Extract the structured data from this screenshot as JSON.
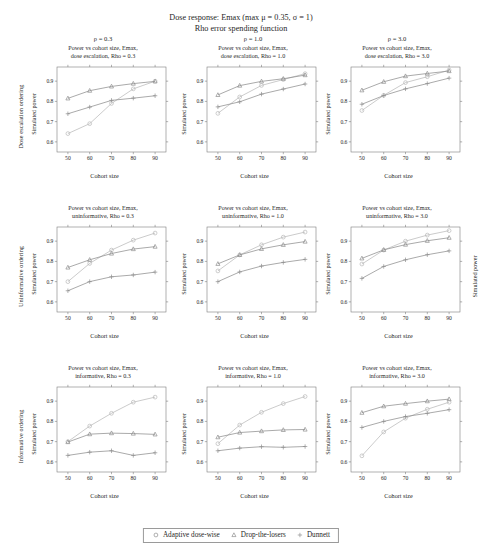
{
  "title": {
    "line1": "Dose response: Emax (max μ = 0.35, σ = 1)",
    "line2": "Rho error spending function"
  },
  "axes": {
    "xlabel": "Cohort size",
    "ylabel": "Simulated power",
    "xticks": [
      "50",
      "60",
      "70",
      "80",
      "90"
    ],
    "yticks": [
      "0.6",
      "0.7",
      "0.8",
      "0.9"
    ]
  },
  "rows": [
    {
      "label": "Dose escalation ordering",
      "key": "dose escalation"
    },
    {
      "label": "Uninformative ordering",
      "key": "uninformative"
    },
    {
      "label": "Informative ordering",
      "key": "informative"
    }
  ],
  "columns": [
    {
      "rho_head": "ρ = 0.3",
      "rho": "0.3"
    },
    {
      "rho_head": "ρ = 1.0",
      "rho": "1.0"
    },
    {
      "rho_head": "ρ = 3.0",
      "rho": "3.0"
    }
  ],
  "legend": {
    "items": [
      {
        "label": "Adaptive dose-wise",
        "marker": "circle-marker"
      },
      {
        "label": "Drop-the-losers",
        "marker": "triangle-marker"
      },
      {
        "label": "Dunnett",
        "marker": "plus-marker"
      }
    ]
  },
  "chart_data": [
    {
      "type": "line",
      "row": 0,
      "col": 0,
      "title_line1": "Power vs cohort size, Emax,",
      "title_line2": "dose escalation, Rho = 0.3",
      "xlabel": "Cohort size",
      "ylabel": "Simulated power",
      "x": [
        50,
        60,
        70,
        80,
        90
      ],
      "xlim": [
        45,
        95
      ],
      "ylim": [
        0.55,
        0.97
      ],
      "grid": false,
      "series": [
        {
          "name": "Adaptive dose-wise",
          "values": [
            0.641,
            0.69,
            0.79,
            0.862,
            0.9
          ]
        },
        {
          "name": "Drop-the-losers",
          "values": [
            0.815,
            0.853,
            0.874,
            0.888,
            0.899
          ]
        },
        {
          "name": "Dunnett",
          "values": [
            0.739,
            0.772,
            0.805,
            0.816,
            0.828
          ]
        }
      ]
    },
    {
      "type": "line",
      "row": 0,
      "col": 1,
      "title_line1": "Power vs cohort size, Emax,",
      "title_line2": "dose escalation, Rho = 1.0",
      "xlabel": "Cohort size",
      "ylabel": "Simulated power",
      "x": [
        50,
        60,
        70,
        80,
        90
      ],
      "xlim": [
        45,
        95
      ],
      "ylim": [
        0.55,
        0.97
      ],
      "grid": false,
      "series": [
        {
          "name": "Adaptive dose-wise",
          "values": [
            0.741,
            0.822,
            0.879,
            0.908,
            0.937
          ]
        },
        {
          "name": "Drop-the-losers",
          "values": [
            0.832,
            0.878,
            0.899,
            0.912,
            0.93
          ]
        },
        {
          "name": "Dunnett",
          "values": [
            0.773,
            0.798,
            0.836,
            0.861,
            0.886
          ]
        }
      ]
    },
    {
      "type": "line",
      "row": 0,
      "col": 2,
      "title_line1": "Power vs cohort size, Emax,",
      "title_line2": "dose escalation, Rho = 3.0",
      "xlabel": "Cohort size",
      "ylabel": "Simulated power",
      "x": [
        50,
        60,
        70,
        80,
        90
      ],
      "xlim": [
        45,
        95
      ],
      "ylim": [
        0.55,
        0.97
      ],
      "grid": false,
      "series": [
        {
          "name": "Adaptive dose-wise",
          "values": [
            0.755,
            0.83,
            0.893,
            0.922,
            0.955
          ]
        },
        {
          "name": "Drop-the-losers",
          "values": [
            0.855,
            0.897,
            0.925,
            0.938,
            0.95
          ]
        },
        {
          "name": "Dunnett",
          "values": [
            0.786,
            0.829,
            0.862,
            0.888,
            0.915
          ]
        }
      ]
    },
    {
      "type": "line",
      "row": 1,
      "col": 0,
      "title_line1": "Power vs cohort size, Emax,",
      "title_line2": "uninformative, Rho = 0.3",
      "xlabel": "Cohort size",
      "ylabel": "Simulated power",
      "x": [
        50,
        60,
        70,
        80,
        90
      ],
      "xlim": [
        45,
        95
      ],
      "ylim": [
        0.55,
        0.97
      ],
      "grid": false,
      "series": [
        {
          "name": "Adaptive dose-wise",
          "values": [
            0.7,
            0.79,
            0.856,
            0.905,
            0.94
          ]
        },
        {
          "name": "Drop-the-losers",
          "values": [
            0.77,
            0.808,
            0.839,
            0.861,
            0.873
          ]
        },
        {
          "name": "Dunnett",
          "values": [
            0.655,
            0.7,
            0.724,
            0.733,
            0.747
          ]
        }
      ]
    },
    {
      "type": "line",
      "row": 1,
      "col": 1,
      "title_line1": "Power vs cohort size, Emax,",
      "title_line2": "uninformative, Rho = 1.0",
      "xlabel": "Cohort size",
      "ylabel": "Simulated power",
      "x": [
        50,
        60,
        70,
        80,
        90
      ],
      "xlim": [
        45,
        95
      ],
      "ylim": [
        0.55,
        0.97
      ],
      "grid": false,
      "series": [
        {
          "name": "Adaptive dose-wise",
          "values": [
            0.753,
            0.832,
            0.882,
            0.92,
            0.945
          ]
        },
        {
          "name": "Drop-the-losers",
          "values": [
            0.788,
            0.832,
            0.862,
            0.882,
            0.898
          ]
        },
        {
          "name": "Dunnett",
          "values": [
            0.7,
            0.748,
            0.777,
            0.795,
            0.81
          ]
        }
      ]
    },
    {
      "type": "line",
      "row": 1,
      "col": 2,
      "title_line1": "Power vs cohort size, Emax,",
      "title_line2": "uninformative, Rho = 3.0",
      "xlabel": "Cohort size",
      "ylabel": "Simulated power",
      "x": [
        50,
        60,
        70,
        80,
        90
      ],
      "xlim": [
        45,
        95
      ],
      "ylim": [
        0.55,
        0.97
      ],
      "grid": false,
      "series": [
        {
          "name": "Adaptive dose-wise",
          "values": [
            0.787,
            0.856,
            0.9,
            0.93,
            0.952
          ]
        },
        {
          "name": "Drop-the-losers",
          "values": [
            0.815,
            0.857,
            0.883,
            0.902,
            0.917
          ]
        },
        {
          "name": "Dunnett",
          "values": [
            0.716,
            0.775,
            0.808,
            0.833,
            0.852
          ]
        }
      ]
    },
    {
      "type": "line",
      "row": 2,
      "col": 0,
      "title_line1": "Power vs cohort size, Emax,",
      "title_line2": "informative, Rho = 0.3",
      "xlabel": "Cohort size",
      "ylabel": "Simulated power",
      "x": [
        50,
        60,
        70,
        80,
        90
      ],
      "xlim": [
        45,
        95
      ],
      "ylim": [
        0.55,
        0.97
      ],
      "grid": false,
      "series": [
        {
          "name": "Adaptive dose-wise",
          "values": [
            0.7,
            0.777,
            0.84,
            0.895,
            0.92
          ]
        },
        {
          "name": "Drop-the-losers",
          "values": [
            0.698,
            0.737,
            0.742,
            0.74,
            0.736
          ]
        },
        {
          "name": "Dunnett",
          "values": [
            0.632,
            0.648,
            0.655,
            0.632,
            0.645
          ]
        }
      ]
    },
    {
      "type": "line",
      "row": 2,
      "col": 1,
      "title_line1": "Power vs cohort size, Emax,",
      "title_line2": "informative, Rho = 1.0",
      "xlabel": "Cohort size",
      "ylabel": "Simulated power",
      "x": [
        50,
        60,
        70,
        80,
        90
      ],
      "xlim": [
        45,
        95
      ],
      "ylim": [
        0.55,
        0.97
      ],
      "grid": false,
      "series": [
        {
          "name": "Adaptive dose-wise",
          "values": [
            0.69,
            0.782,
            0.845,
            0.888,
            0.923
          ]
        },
        {
          "name": "Drop-the-losers",
          "values": [
            0.722,
            0.745,
            0.752,
            0.758,
            0.76
          ]
        },
        {
          "name": "Dunnett",
          "values": [
            0.655,
            0.668,
            0.675,
            0.672,
            0.676
          ]
        }
      ]
    },
    {
      "type": "line",
      "row": 2,
      "col": 2,
      "title_line1": "Power vs cohort size, Emax,",
      "title_line2": "informative, Rho = 3.0",
      "xlabel": "Cohort size",
      "ylabel": "Simulated power",
      "x": [
        50,
        60,
        70,
        80,
        90
      ],
      "xlim": [
        45,
        95
      ],
      "ylim": [
        0.55,
        0.97
      ],
      "grid": false,
      "series": [
        {
          "name": "Adaptive dose-wise",
          "values": [
            0.63,
            0.748,
            0.816,
            0.86,
            0.895
          ]
        },
        {
          "name": "Drop-the-losers",
          "values": [
            0.843,
            0.875,
            0.888,
            0.9,
            0.91
          ]
        },
        {
          "name": "Dunnett",
          "values": [
            0.77,
            0.8,
            0.824,
            0.84,
            0.858
          ]
        }
      ]
    }
  ]
}
